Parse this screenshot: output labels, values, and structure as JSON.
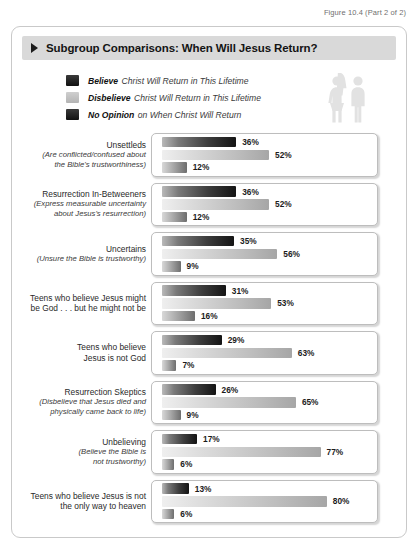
{
  "figure_caption": "Figure 10.4 (Part 2 of 2)",
  "title": "Subgroup Comparisons: When Will Jesus Return?",
  "legend": [
    {
      "swatch": "dark",
      "strong": "Believe",
      "rest": "Christ Will Return in This Lifetime"
    },
    {
      "swatch": "light",
      "strong": "Disbelieve",
      "rest": "Christ Will Return in This Lifetime"
    },
    {
      "swatch": "none",
      "strong": "No Opinion",
      "rest": "on When Christ Will Return"
    }
  ],
  "icons": {
    "female": "female-figure-icon",
    "male": "male-figure-icon"
  },
  "chart_data": {
    "type": "bar",
    "title": "Subgroup Comparisons: When Will Jesus Return?",
    "xlabel": "",
    "ylabel": "",
    "xlim": [
      0,
      100
    ],
    "grid": false,
    "legend_position": "top",
    "series": [
      {
        "name": "Believe Christ Will Return in This Lifetime",
        "key": "dark",
        "values": [
          36,
          36,
          35,
          31,
          29,
          26,
          17,
          13
        ]
      },
      {
        "name": "Disbelieve Christ Will Return in This Lifetime",
        "key": "light",
        "values": [
          52,
          52,
          56,
          53,
          63,
          65,
          77,
          80
        ]
      },
      {
        "name": "No Opinion on When Christ Will Return",
        "key": "none",
        "values": [
          12,
          12,
          9,
          16,
          7,
          9,
          6,
          6
        ]
      }
    ],
    "categories": [
      "Unsettleds (Are conflicted/confused about the Bible's trustworthiness)",
      "Resurrection In-Betweeners (Express measurable uncertainty about Jesus's resurrection)",
      "Uncertains (Unsure the Bible is trustworthy)",
      "Teens who believe Jesus might be God . . . but he might not be",
      "Teens who believe Jesus is not God",
      "Resurrection Skeptics (Disbelieve that Jesus died and physically came back to life)",
      "Unbelieving (Believe the Bible is not trustworthy)",
      "Teens who believe Jesus is not the only way to heaven"
    ],
    "rows": [
      {
        "label_lines": [
          "Unsettleds"
        ],
        "sub_lines": [
          "(Are conflicted/confused about",
          "the Bible's trustworthiness)"
        ],
        "bars": [
          {
            "key": "dark",
            "value": 36,
            "value_label": "36%"
          },
          {
            "key": "light",
            "value": 52,
            "value_label": "52%"
          },
          {
            "key": "none",
            "value": 12,
            "value_label": "12%"
          }
        ]
      },
      {
        "label_lines": [
          "Resurrection In-Betweeners"
        ],
        "sub_lines": [
          "(Express measurable uncertainty",
          "about Jesus's resurrection)"
        ],
        "bars": [
          {
            "key": "dark",
            "value": 36,
            "value_label": "36%"
          },
          {
            "key": "light",
            "value": 52,
            "value_label": "52%"
          },
          {
            "key": "none",
            "value": 12,
            "value_label": "12%"
          }
        ]
      },
      {
        "label_lines": [
          "Uncertains"
        ],
        "sub_lines": [
          "(Unsure the Bible is trustworthy)"
        ],
        "bars": [
          {
            "key": "dark",
            "value": 35,
            "value_label": "35%"
          },
          {
            "key": "light",
            "value": 56,
            "value_label": "56%"
          },
          {
            "key": "none",
            "value": 9,
            "value_label": "9%"
          }
        ]
      },
      {
        "label_lines": [
          "Teens who believe Jesus might",
          "be God . . . but he might not be"
        ],
        "sub_lines": [],
        "bars": [
          {
            "key": "dark",
            "value": 31,
            "value_label": "31%"
          },
          {
            "key": "light",
            "value": 53,
            "value_label": "53%"
          },
          {
            "key": "none",
            "value": 16,
            "value_label": "16%"
          }
        ]
      },
      {
        "label_lines": [
          "Teens who believe",
          "Jesus is not God"
        ],
        "sub_lines": [],
        "bars": [
          {
            "key": "dark",
            "value": 29,
            "value_label": "29%"
          },
          {
            "key": "light",
            "value": 63,
            "value_label": "63%"
          },
          {
            "key": "none",
            "value": 7,
            "value_label": "7%"
          }
        ]
      },
      {
        "label_lines": [
          "Resurrection Skeptics"
        ],
        "sub_lines": [
          "(Disbelieve that Jesus died and",
          "physically came back to life)"
        ],
        "bars": [
          {
            "key": "dark",
            "value": 26,
            "value_label": "26%"
          },
          {
            "key": "light",
            "value": 65,
            "value_label": "65%"
          },
          {
            "key": "none",
            "value": 9,
            "value_label": "9%"
          }
        ]
      },
      {
        "label_lines": [
          "Unbelieving"
        ],
        "sub_lines": [
          "(Believe the Bible is",
          "not trustworthy)"
        ],
        "bars": [
          {
            "key": "dark",
            "value": 17,
            "value_label": "17%"
          },
          {
            "key": "light",
            "value": 77,
            "value_label": "77%"
          },
          {
            "key": "none",
            "value": 6,
            "value_label": "6%"
          }
        ]
      },
      {
        "label_lines": [
          "Teens who believe Jesus is not",
          "the only way to heaven"
        ],
        "sub_lines": [],
        "bars": [
          {
            "key": "dark",
            "value": 13,
            "value_label": "13%"
          },
          {
            "key": "light",
            "value": 80,
            "value_label": "80%"
          },
          {
            "key": "none",
            "value": 6,
            "value_label": "6%"
          }
        ]
      }
    ]
  }
}
